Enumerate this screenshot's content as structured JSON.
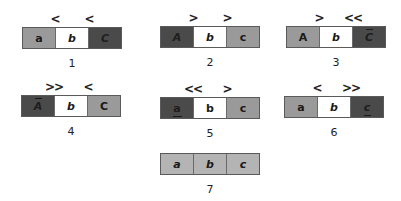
{
  "colors": {
    "light_gray": "#9a9a9a",
    "dark_gray": "#4a4a4a",
    "white": "#ffffff",
    "pale_gray": "#b4b4b4",
    "border": "#5a5a5a"
  },
  "diagrams": [
    {
      "label": "1",
      "markers": [
        "<",
        "<"
      ],
      "cells": [
        {
          "text": "a",
          "shade": "light",
          "style": "upright",
          "decoration": "none"
        },
        {
          "text": "b",
          "shade": "white",
          "style": "italic",
          "decoration": "none"
        },
        {
          "text": "C",
          "shade": "dark",
          "style": "italic",
          "decoration": "none"
        }
      ]
    },
    {
      "label": "2",
      "markers": [
        ">",
        ">"
      ],
      "cells": [
        {
          "text": "A",
          "shade": "dark",
          "style": "italic",
          "decoration": "none"
        },
        {
          "text": "b",
          "shade": "white",
          "style": "italic",
          "decoration": "none"
        },
        {
          "text": "c",
          "shade": "light",
          "style": "upright",
          "decoration": "none"
        }
      ]
    },
    {
      "label": "3",
      "markers": [
        ">",
        "<<"
      ],
      "cells": [
        {
          "text": "A",
          "shade": "light",
          "style": "upright",
          "decoration": "none"
        },
        {
          "text": "b",
          "shade": "white",
          "style": "italic",
          "decoration": "none"
        },
        {
          "text": "C",
          "shade": "dark",
          "style": "italic",
          "decoration": "overline"
        }
      ]
    },
    {
      "label": "4",
      "markers": [
        ">>",
        "<"
      ],
      "cells": [
        {
          "text": "A",
          "shade": "dark",
          "style": "italic",
          "decoration": "overline"
        },
        {
          "text": "b",
          "shade": "white",
          "style": "italic",
          "decoration": "none"
        },
        {
          "text": "C",
          "shade": "light",
          "style": "upright",
          "decoration": "none"
        }
      ]
    },
    {
      "label": "5",
      "markers": [
        "<<",
        ">"
      ],
      "cells": [
        {
          "text": "a",
          "shade": "dark",
          "style": "upright",
          "decoration": "underline"
        },
        {
          "text": "b",
          "shade": "white",
          "style": "upright",
          "decoration": "none"
        },
        {
          "text": "c",
          "shade": "light",
          "style": "upright",
          "decoration": "none"
        }
      ]
    },
    {
      "label": "6",
      "markers": [
        "<",
        ">>"
      ],
      "cells": [
        {
          "text": "a",
          "shade": "light",
          "style": "upright",
          "decoration": "none"
        },
        {
          "text": "b",
          "shade": "white",
          "style": "italic",
          "decoration": "none"
        },
        {
          "text": "c",
          "shade": "dark",
          "style": "italic",
          "decoration": "underline"
        }
      ]
    },
    {
      "label": "7",
      "markers": [],
      "cells": [
        {
          "text": "a",
          "shade": "pale",
          "style": "italic",
          "decoration": "none"
        },
        {
          "text": "b",
          "shade": "pale",
          "style": "italic",
          "decoration": "none"
        },
        {
          "text": "c",
          "shade": "pale",
          "style": "italic",
          "decoration": "none"
        }
      ]
    }
  ]
}
